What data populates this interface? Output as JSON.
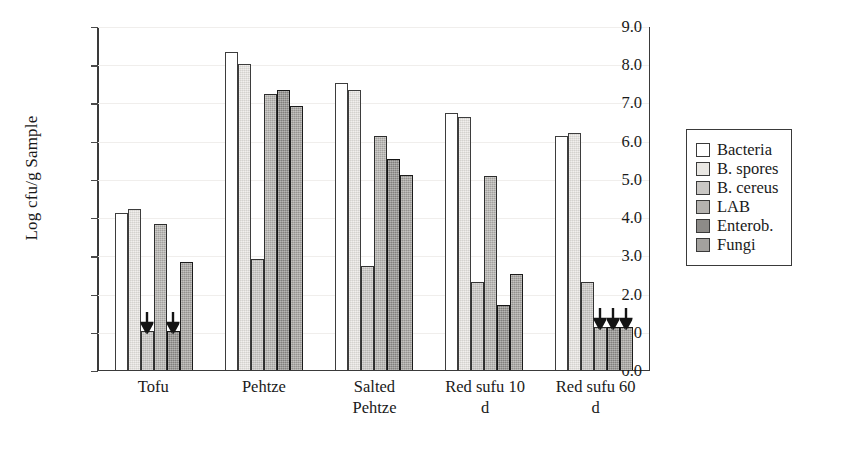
{
  "chart_data": {
    "type": "bar",
    "title": "",
    "xlabel": "",
    "ylabel": "Log cfu/g Sample",
    "ylim": [
      0.0,
      9.0
    ],
    "ytick_step": 1.0,
    "yticks": [
      "9.0",
      "8.0",
      "7.0",
      "6.0",
      "5.0",
      "4.0",
      "3.0",
      "2.0",
      "1.0",
      "0.0"
    ],
    "grid": true,
    "legend_position": "right",
    "categories": [
      "Tofu",
      "Pehtze",
      "Salted Pehtze",
      "Red sufu 10 d",
      "Red sufu 60 d"
    ],
    "category_labels_multiline": [
      "Tofu",
      "Pehtze",
      "Salted\nPehtze",
      "Red sufu 10\nd",
      "Red sufu 60\nd"
    ],
    "series": [
      {
        "name": "Bacteria",
        "color": "#ffffff",
        "values": [
          4.1,
          8.3,
          7.5,
          6.7,
          6.1
        ],
        "below_detection": [
          false,
          false,
          false,
          false,
          false
        ]
      },
      {
        "name": "B. spores",
        "color": "#e9e7e3",
        "values": [
          4.2,
          8.0,
          7.3,
          6.6,
          6.2
        ],
        "below_detection": [
          false,
          false,
          false,
          false,
          false
        ]
      },
      {
        "name": "B. cereus",
        "color": "#c9c7c4",
        "values": [
          1.0,
          2.9,
          2.7,
          2.3,
          2.3
        ],
        "below_detection": [
          true,
          false,
          false,
          false,
          false
        ]
      },
      {
        "name": "LAB",
        "color": "#b4b2af",
        "values": [
          3.8,
          7.2,
          6.1,
          5.05,
          1.1
        ],
        "below_detection": [
          false,
          false,
          false,
          false,
          true
        ]
      },
      {
        "name": "Enterob.",
        "color": "#8d8b88",
        "values": [
          1.0,
          7.3,
          5.5,
          1.7,
          1.1
        ],
        "below_detection": [
          true,
          false,
          false,
          false,
          true
        ]
      },
      {
        "name": "Fungi",
        "color": "#a3a19e",
        "values": [
          2.8,
          6.9,
          5.1,
          2.5,
          1.1
        ],
        "below_detection": [
          false,
          false,
          false,
          false,
          true
        ]
      }
    ],
    "annotation_note": "Downward arrows mark values at or below the detection limit"
  },
  "legend": {
    "items": [
      {
        "label": "Bacteria"
      },
      {
        "label": "B. spores"
      },
      {
        "label": "B. cereus"
      },
      {
        "label": "LAB"
      },
      {
        "label": "Enterob."
      },
      {
        "label": "Fungi"
      }
    ]
  }
}
